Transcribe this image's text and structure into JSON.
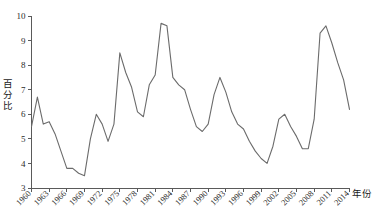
{
  "chart_data": {
    "type": "line",
    "title": "",
    "xlabel": "年份",
    "ylabel": "百分比",
    "xlim": [
      1960,
      2014
    ],
    "ylim": [
      3,
      10
    ],
    "grid": false,
    "legend": "none",
    "ytick_labels": [
      "10",
      "9",
      "8",
      "7",
      "6",
      "5",
      "4",
      "3"
    ],
    "ytick_values": [
      10,
      9,
      8,
      7,
      6,
      5,
      4,
      3
    ],
    "xtick_labels": [
      "1960",
      "1963",
      "1966",
      "1969",
      "1972",
      "1975",
      "1978",
      "1981",
      "1984",
      "1987",
      "1990",
      "1993",
      "1996",
      "1999",
      "2002",
      "2005",
      "2008",
      "2011",
      "2014"
    ],
    "xtick_values": [
      1960,
      1963,
      1966,
      1969,
      1972,
      1975,
      1978,
      1981,
      1984,
      1987,
      1990,
      1993,
      1996,
      1999,
      2002,
      2005,
      2008,
      2011,
      2014
    ],
    "line_color": "#6b6b6b",
    "series": [
      {
        "name": "百分比",
        "x": [
          1960,
          1961,
          1962,
          1963,
          1964,
          1965,
          1966,
          1967,
          1968,
          1969,
          1970,
          1971,
          1972,
          1973,
          1974,
          1975,
          1976,
          1977,
          1978,
          1979,
          1980,
          1981,
          1982,
          1983,
          1984,
          1985,
          1986,
          1987,
          1988,
          1989,
          1990,
          1991,
          1992,
          1993,
          1994,
          1995,
          1996,
          1997,
          1998,
          1999,
          2000,
          2001,
          2002,
          2003,
          2004,
          2005,
          2006,
          2007,
          2008,
          2009,
          2010,
          2011,
          2012,
          2013,
          2014
        ],
        "values": [
          5.5,
          6.7,
          5.6,
          5.7,
          5.2,
          4.5,
          3.8,
          3.8,
          3.6,
          3.5,
          5.0,
          6.0,
          5.6,
          4.9,
          5.6,
          8.5,
          7.7,
          7.1,
          6.1,
          5.9,
          7.2,
          7.6,
          9.7,
          9.6,
          7.5,
          7.2,
          7.0,
          6.2,
          5.5,
          5.3,
          5.6,
          6.8,
          7.5,
          6.9,
          6.1,
          5.6,
          5.4,
          4.9,
          4.5,
          4.2,
          4.0,
          4.7,
          5.8,
          6.0,
          5.5,
          5.1,
          4.6,
          4.6,
          5.8,
          9.3,
          9.6,
          8.9,
          8.1,
          7.4,
          6.2
        ]
      }
    ]
  },
  "axis": {
    "y_title": "百分比",
    "x_title": "年份"
  }
}
